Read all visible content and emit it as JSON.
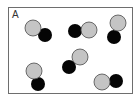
{
  "panel": {
    "label": "A"
  },
  "colors": {
    "frame": "#6e6e6e",
    "light_atom_fill": "#c4c4c4",
    "light_atom_stroke": "#4a4a4a",
    "dark_atom_fill": "#050505"
  },
  "molecules": [
    {
      "light": {
        "cx": 33,
        "cy": 28,
        "r": 8
      },
      "dark": {
        "cx": 45,
        "cy": 35,
        "r": 7
      }
    },
    {
      "light": {
        "cx": 89,
        "cy": 30,
        "r": 8
      },
      "dark": {
        "cx": 75,
        "cy": 31,
        "r": 7
      }
    },
    {
      "light": {
        "cx": 118,
        "cy": 23,
        "r": 8
      },
      "dark": {
        "cx": 114,
        "cy": 37,
        "r": 7
      }
    },
    {
      "light": {
        "cx": 80,
        "cy": 57,
        "r": 8
      },
      "dark": {
        "cx": 69,
        "cy": 67,
        "r": 7
      }
    },
    {
      "light": {
        "cx": 34,
        "cy": 71,
        "r": 8
      },
      "dark": {
        "cx": 38,
        "cy": 84,
        "r": 7
      }
    },
    {
      "light": {
        "cx": 102,
        "cy": 82,
        "r": 8
      },
      "dark": {
        "cx": 116,
        "cy": 81,
        "r": 7
      }
    }
  ]
}
